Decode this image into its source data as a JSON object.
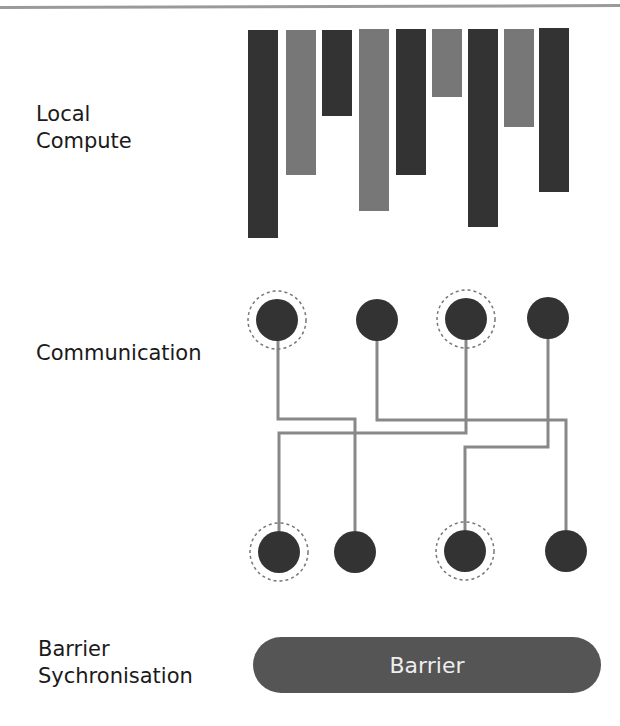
{
  "sections": {
    "local_compute": {
      "line1": "Local",
      "line2": "Compute"
    },
    "communication": {
      "label": "Communication"
    },
    "barrier_sync": {
      "line1": "Barrier",
      "line2": "Sychronisation"
    }
  },
  "barrier": {
    "label": "Barrier"
  },
  "colors": {
    "dark_bar": "#333333",
    "light_bar": "#777777",
    "node": "#333333",
    "line": "#888888",
    "barrier_fill": "#555555",
    "barrier_text": "#eeeeee"
  },
  "compute_bars": [
    {
      "x": 248,
      "width": 30,
      "top": 30,
      "bottom": 238,
      "shade": "dark"
    },
    {
      "x": 286,
      "width": 30,
      "top": 30,
      "bottom": 175,
      "shade": "light"
    },
    {
      "x": 322,
      "width": 30,
      "top": 30,
      "bottom": 116,
      "shade": "dark"
    },
    {
      "x": 359,
      "width": 30,
      "top": 29,
      "bottom": 211,
      "shade": "light"
    },
    {
      "x": 396,
      "width": 30,
      "top": 29,
      "bottom": 175,
      "shade": "dark"
    },
    {
      "x": 432,
      "width": 30,
      "top": 29,
      "bottom": 97,
      "shade": "light"
    },
    {
      "x": 468,
      "width": 30,
      "top": 29,
      "bottom": 227,
      "shade": "dark"
    },
    {
      "x": 504,
      "width": 30,
      "top": 29,
      "bottom": 127,
      "shade": "light"
    },
    {
      "x": 539,
      "width": 30,
      "top": 28,
      "bottom": 192,
      "shade": "dark"
    }
  ],
  "top_nodes": [
    {
      "cx": 277,
      "cy": 320,
      "highlighted": true
    },
    {
      "cx": 377,
      "cy": 320,
      "highlighted": false
    },
    {
      "cx": 466,
      "cy": 319,
      "highlighted": true
    },
    {
      "cx": 548,
      "cy": 318,
      "highlighted": false
    }
  ],
  "bottom_nodes": [
    {
      "cx": 279,
      "cy": 552,
      "highlighted": true
    },
    {
      "cx": 355,
      "cy": 552,
      "highlighted": false
    },
    {
      "cx": 465,
      "cy": 551,
      "highlighted": true
    },
    {
      "cx": 566,
      "cy": 551,
      "highlighted": false
    }
  ],
  "connections": [
    {
      "from": "top-1",
      "to": "bottom-2",
      "points": "278,340 278,419 355,419 355,531"
    },
    {
      "from": "top-2",
      "to": "bottom-4",
      "points": "377,340 377,420 566,420 566,530"
    },
    {
      "from": "top-3",
      "to": "bottom-1",
      "points": "466,339 466,433 279,433 279,531"
    },
    {
      "from": "top-4",
      "to": "bottom-3",
      "points": "548,338 548,447 465,447 465,530"
    }
  ]
}
